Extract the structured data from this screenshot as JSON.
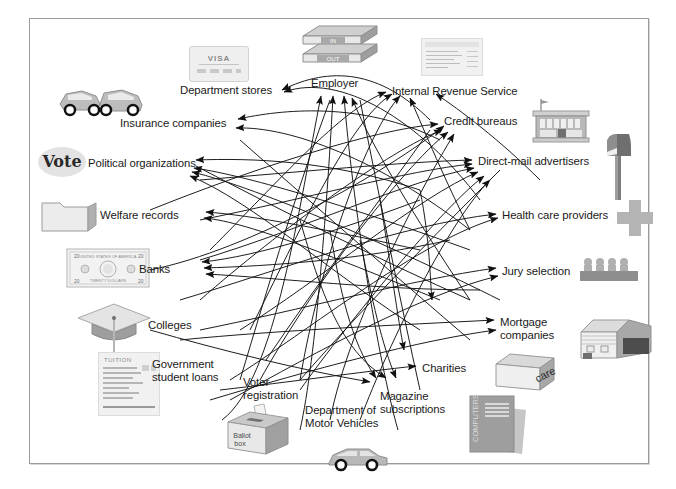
{
  "diagram": {
    "frame": {
      "border_color": "#9a9a9a",
      "background": "#ffffff"
    },
    "nodes": [
      {
        "id": "department-stores",
        "label": "Department stores",
        "x": 180,
        "y": 84,
        "align": "left"
      },
      {
        "id": "employer",
        "label": "Employer",
        "x": 311,
        "y": 77,
        "align": "left"
      },
      {
        "id": "internal-revenue",
        "label": "Internal Revenue Service",
        "x": 392,
        "y": 85,
        "align": "left"
      },
      {
        "id": "insurance-companies",
        "label": "Insurance companies",
        "x": 120,
        "y": 117,
        "align": "left"
      },
      {
        "id": "credit-bureaus",
        "label": "Credit bureaus",
        "x": 444,
        "y": 115,
        "align": "left"
      },
      {
        "id": "political-organizations",
        "label": "Political organizations",
        "x": 88,
        "y": 157,
        "align": "left"
      },
      {
        "id": "direct-mail",
        "label": "Direct-mail advertisers",
        "x": 478,
        "y": 155,
        "align": "left"
      },
      {
        "id": "welfare-records",
        "label": "Welfare records",
        "x": 100,
        "y": 209,
        "align": "left"
      },
      {
        "id": "health-care",
        "label": "Health care providers",
        "x": 502,
        "y": 209,
        "align": "left"
      },
      {
        "id": "banks",
        "label": "Banks",
        "x": 139,
        "y": 263,
        "align": "left"
      },
      {
        "id": "jury-selection",
        "label": "Jury selection",
        "x": 502,
        "y": 265,
        "align": "left"
      },
      {
        "id": "colleges",
        "label": "Colleges",
        "x": 148,
        "y": 319,
        "align": "left"
      },
      {
        "id": "mortgage-companies",
        "label": "Mortgage\ncompanies",
        "x": 500,
        "y": 316,
        "align": "left"
      },
      {
        "id": "government-loans",
        "label": "Government\nstudent loans",
        "x": 152,
        "y": 358,
        "align": "left"
      },
      {
        "id": "charities",
        "label": "Charities",
        "x": 422,
        "y": 362,
        "align": "left"
      },
      {
        "id": "voter-registration",
        "label": "Voter\nregistration",
        "x": 243,
        "y": 376,
        "align": "left"
      },
      {
        "id": "magazine-subscriptions",
        "label": "Magazine\nsubscriptions",
        "x": 380,
        "y": 390,
        "align": "left"
      },
      {
        "id": "dmv",
        "label": "Department of\nMotor Vehicles",
        "x": 305,
        "y": 404,
        "align": "left"
      }
    ],
    "icons": [
      {
        "id": "credit-card-icon",
        "name": "VISA",
        "x": 189,
        "y": 46
      },
      {
        "id": "car-crash-icon",
        "name": "",
        "x": 56,
        "y": 78
      },
      {
        "id": "in-out-tray-icon",
        "name": "IN / OUT",
        "x": 293,
        "y": 22
      },
      {
        "id": "tax-form-icon",
        "name": "",
        "x": 421,
        "y": 38
      },
      {
        "id": "bank-building-icon",
        "name": "",
        "x": 529,
        "y": 97
      },
      {
        "id": "vote-badge-icon",
        "name": "Vote",
        "x": 38,
        "y": 147
      },
      {
        "id": "mailbox-icon",
        "name": "",
        "x": 601,
        "y": 130
      },
      {
        "id": "file-folder-icon",
        "name": "",
        "x": 38,
        "y": 195
      },
      {
        "id": "medical-cross-icon",
        "name": "",
        "x": 617,
        "y": 200
      },
      {
        "id": "dollar-bill-icon",
        "name": "",
        "x": 66,
        "y": 248
      },
      {
        "id": "jury-box-icon",
        "name": "",
        "x": 578,
        "y": 254
      },
      {
        "id": "graduation-cap-icon",
        "name": "",
        "x": 74,
        "y": 300
      },
      {
        "id": "house-icon",
        "name": "",
        "x": 577,
        "y": 312
      },
      {
        "id": "tuition-bill-icon",
        "name": "TUITION",
        "x": 98,
        "y": 352
      },
      {
        "id": "charity-box-icon",
        "name": "care",
        "x": 492,
        "y": 350
      },
      {
        "id": "ballot-box-icon",
        "name": "Ballot\nbox",
        "x": 224,
        "y": 402
      },
      {
        "id": "magazine-icon",
        "name": "COMPUTERS",
        "x": 466,
        "y": 392
      },
      {
        "id": "sedan-car-icon",
        "name": "",
        "x": 325,
        "y": 444
      }
    ],
    "palette": {
      "line": "#1a1a1a",
      "icon_light": "#dcdcdc",
      "icon_mid": "#b8b8b8",
      "icon_dark": "#8c8c8c",
      "text": "#1a1a1a"
    }
  }
}
